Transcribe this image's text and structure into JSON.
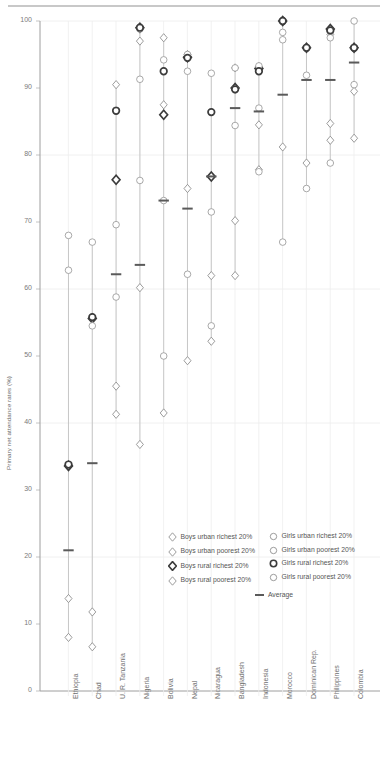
{
  "chart_data": {
    "type": "scatter",
    "title": "",
    "xlabel": "",
    "ylabel": "Primary net attendance rates (%)",
    "ylim": [
      0,
      100
    ],
    "yticks": [
      0,
      10,
      20,
      30,
      40,
      50,
      60,
      70,
      80,
      90,
      100
    ],
    "grid": true,
    "legend_position": "bottom-right",
    "categories": [
      "Ethiopia",
      "Chad",
      "U. R. Tanzania",
      "Nigeria",
      "Bolivia",
      "Nepal",
      "Nicaragua",
      "Bangladesh",
      "Indonesia",
      "Morocco",
      "Dominican Rep.",
      "Philippines",
      "Colombia"
    ],
    "series": [
      {
        "name": "Boys urban richest 20%",
        "marker": "diamond-open",
        "color": "#8a8a8a",
        "values": [
          null,
          null,
          90.5,
          97.0,
          97.5,
          95.0,
          null,
          93.0,
          93.2,
          null,
          null,
          98.0,
          null
        ]
      },
      {
        "name": "Boys urban poorest 20%",
        "marker": "diamond-open",
        "color": "#8a8a8a",
        "values": [
          13.8,
          11.8,
          45.5,
          36.8,
          87.5,
          75.0,
          52.2,
          70.2,
          84.5,
          null,
          null,
          84.7,
          89.5
        ]
      },
      {
        "name": "Boys rural richest 20%",
        "marker": "diamond-bold",
        "color": "#3c3c3c",
        "values": [
          33.6,
          55.6,
          76.3,
          99.0,
          86.0,
          94.6,
          76.8,
          90.0,
          92.9,
          100.0,
          96.0,
          98.8,
          96.0
        ]
      },
      {
        "name": "Boys rural poorest 20%",
        "marker": "diamond-open",
        "color": "#8a8a8a",
        "values": [
          8.0,
          6.6,
          41.3,
          60.2,
          41.5,
          49.3,
          62.0,
          62.0,
          77.8,
          81.2,
          78.8,
          82.2,
          82.5
        ]
      },
      {
        "name": "Girls urban richest 20%",
        "marker": "circle-open",
        "color": "#9a9a9a",
        "values": [
          68.0,
          67.0,
          86.7,
          98.8,
          94.2,
          95.0,
          92.2,
          93.0,
          93.3,
          98.3,
          96.0,
          98.4,
          100.0
        ]
      },
      {
        "name": "Girls urban poorest 20%",
        "marker": "circle-open",
        "color": "#9a9a9a",
        "values": [
          null,
          null,
          69.6,
          91.3,
          50.0,
          62.2,
          54.5,
          89.8,
          87.0,
          97.2,
          91.9,
          97.5,
          96.0
        ]
      },
      {
        "name": "Girls rural richest 20%",
        "marker": "circle-bold",
        "color": "#3c3c3c",
        "values": [
          33.8,
          55.8,
          86.6,
          99.0,
          92.5,
          94.5,
          86.4,
          89.8,
          92.5,
          100.0,
          96.0,
          98.6,
          96.0
        ]
      },
      {
        "name": "Girls rural poorest 20%",
        "marker": "circle-open",
        "color": "#9a9a9a",
        "values": [
          62.8,
          54.5,
          58.8,
          76.2,
          73.2,
          92.5,
          71.5,
          84.4,
          77.5,
          67.0,
          75.0,
          78.8,
          90.5
        ]
      },
      {
        "name": "Average",
        "marker": "bar",
        "color": "#5a5a5a",
        "values": [
          21.0,
          34.0,
          62.2,
          63.6,
          73.2,
          72.0,
          76.8,
          87.0,
          86.5,
          89.0,
          91.2,
          91.2,
          93.8
        ]
      }
    ]
  },
  "legend": {
    "left_column": [
      {
        "label": "Boys urban richest 20%",
        "marker": "diamond-open"
      },
      {
        "label": "Boys urban poorest 20%",
        "marker": "diamond-open"
      },
      {
        "label": "Boys rural richest 20%",
        "marker": "diamond-bold"
      },
      {
        "label": "Boys rural poorest 20%",
        "marker": "diamond-open"
      }
    ],
    "right_column": [
      {
        "label": "Girls urban richest 20%",
        "marker": "circle-open"
      },
      {
        "label": "Girls urban poorest 20%",
        "marker": "circle-open"
      },
      {
        "label": "Girls rural richest 20%",
        "marker": "circle-bold"
      },
      {
        "label": "Girls rural poorest 20%",
        "marker": "circle-open"
      }
    ],
    "average": {
      "label": "Average",
      "marker": "bar"
    }
  }
}
